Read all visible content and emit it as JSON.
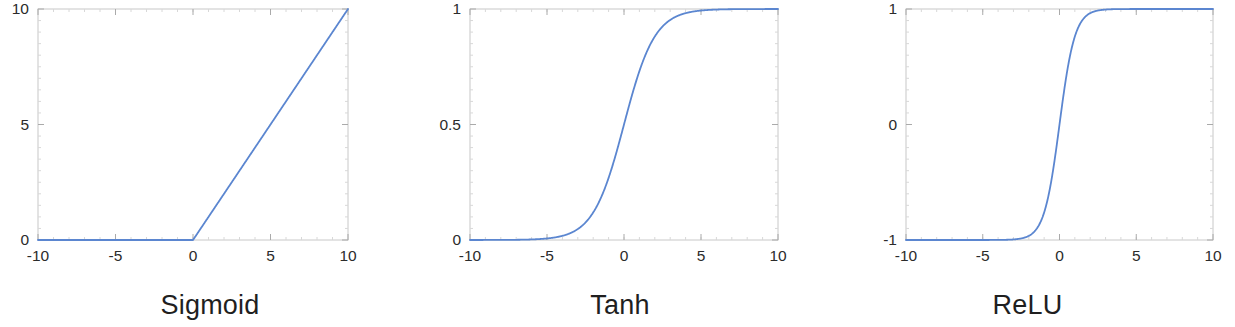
{
  "figure": {
    "background": "#ffffff",
    "line_color": "#5b86d0",
    "axis_color": "#c8c8c8",
    "tick_label_color": "#2b2b2b",
    "caption_color": "#1f1f1f"
  },
  "panels": [
    {
      "caption": "Sigmoid",
      "caption_center_x": 175,
      "plot": {
        "left": 38,
        "top": 9,
        "right": 348,
        "bottom": 240
      },
      "x_ticks": [
        "-10",
        "-5",
        "0",
        "5",
        "10"
      ],
      "y_ticks": [
        "0",
        "5",
        "10"
      ]
    },
    {
      "caption": "Tanh",
      "caption_center_x": 613,
      "plot": {
        "left": 470,
        "top": 9,
        "right": 778,
        "bottom": 240
      },
      "x_ticks": [
        "-10",
        "-5",
        "0",
        "5",
        "10"
      ],
      "y_ticks": [
        "0",
        "0.5",
        "1"
      ]
    },
    {
      "caption": "ReLU",
      "caption_center_x": 1047,
      "plot": {
        "left": 906,
        "top": 9,
        "right": 1213,
        "bottom": 240
      },
      "x_ticks": [
        "-10",
        "-5",
        "0",
        "5",
        "10"
      ],
      "y_ticks": [
        "-1",
        "0",
        "1"
      ]
    }
  ],
  "chart_data": [
    {
      "type": "line",
      "title": "Sigmoid",
      "xlabel": "",
      "ylabel": "",
      "xlim": [
        -10,
        10
      ],
      "ylim": [
        0,
        10
      ],
      "xtick_values": [
        -10,
        -5,
        0,
        5,
        10
      ],
      "xtick_labels": [
        "-10",
        "-5",
        "0",
        "5",
        "10"
      ],
      "ytick_values": [
        0,
        5,
        10
      ],
      "ytick_labels": [
        "0",
        "5",
        "10"
      ],
      "grid": false,
      "legend": null,
      "minor_ticks": true,
      "function": "relu(x) = max(0, x)",
      "series": [
        {
          "name": "max(0, x)",
          "color": "#5b86d0",
          "x": [
            -10,
            -9,
            -8,
            -7,
            -6,
            -5,
            -4,
            -3,
            -2,
            -1,
            0,
            1,
            2,
            3,
            4,
            5,
            6,
            7,
            8,
            9,
            10
          ],
          "values": [
            0,
            0,
            0,
            0,
            0,
            0,
            0,
            0,
            0,
            0,
            0,
            1,
            2,
            3,
            4,
            5,
            6,
            7,
            8,
            9,
            10
          ]
        }
      ]
    },
    {
      "type": "line",
      "title": "Tanh",
      "xlabel": "",
      "ylabel": "",
      "xlim": [
        -10,
        10
      ],
      "ylim": [
        0,
        1
      ],
      "xtick_values": [
        -10,
        -5,
        0,
        5,
        10
      ],
      "xtick_labels": [
        "-10",
        "-5",
        "0",
        "5",
        "10"
      ],
      "ytick_values": [
        0,
        0.5,
        1
      ],
      "ytick_labels": [
        "0",
        "0.5",
        "1"
      ],
      "grid": false,
      "legend": null,
      "minor_ticks": true,
      "function": "sigmoid(x) = 1 / (1 + exp(-x))",
      "series": [
        {
          "name": "1/(1+exp(-x))",
          "color": "#5b86d0",
          "x": [
            -10,
            -8,
            -6,
            -5,
            -4,
            -3,
            -2,
            -1,
            0,
            1,
            2,
            3,
            4,
            5,
            6,
            8,
            10
          ],
          "values": [
            4.54e-05,
            0.000335,
            0.00247,
            0.00669,
            0.018,
            0.0474,
            0.119,
            0.269,
            0.5,
            0.731,
            0.881,
            0.953,
            0.982,
            0.993,
            0.998,
            0.99966,
            0.99995
          ]
        }
      ]
    },
    {
      "type": "line",
      "title": "ReLU",
      "xlabel": "",
      "ylabel": "",
      "xlim": [
        -10,
        10
      ],
      "ylim": [
        -1,
        1
      ],
      "xtick_values": [
        -10,
        -5,
        0,
        5,
        10
      ],
      "xtick_labels": [
        "-10",
        "-5",
        "0",
        "5",
        "10"
      ],
      "ytick_values": [
        -1,
        0,
        1
      ],
      "ytick_labels": [
        "-1",
        "0",
        "1"
      ],
      "grid": false,
      "legend": null,
      "minor_ticks": true,
      "function": "tanh(x)",
      "series": [
        {
          "name": "tanh(x)",
          "color": "#5b86d0",
          "x": [
            -10,
            -8,
            -6,
            -5,
            -4,
            -3,
            -2,
            -1,
            -0.5,
            0,
            0.5,
            1,
            2,
            3,
            4,
            5,
            6,
            8,
            10
          ],
          "values": [
            -1.0,
            -1.0,
            -0.99999,
            -0.9999,
            -0.9993,
            -0.9951,
            -0.964,
            -0.762,
            -0.462,
            0.0,
            0.462,
            0.762,
            0.964,
            0.9951,
            0.9993,
            0.9999,
            0.99999,
            1.0,
            1.0
          ]
        }
      ]
    }
  ]
}
